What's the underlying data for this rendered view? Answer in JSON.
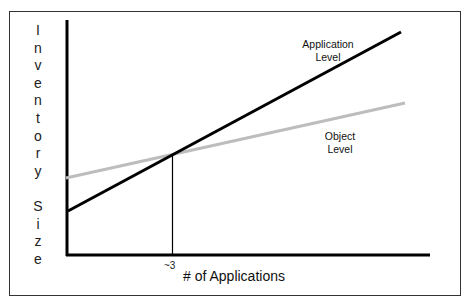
{
  "chart_data": {
    "type": "line",
    "title": "",
    "xlabel": "# of Applications",
    "ylabel": "Inventory Size",
    "x_ticks": [
      "~3"
    ],
    "grid": false,
    "legend": "inline labels",
    "series": [
      {
        "name": "Application Level",
        "color": "#000000",
        "x": [
          0,
          10
        ],
        "y": [
          1.0,
          5.2
        ],
        "note": "steeper line, starts lower"
      },
      {
        "name": "Object Level",
        "color": "#bbbbbb",
        "x": [
          0,
          10
        ],
        "y": [
          1.7,
          3.3
        ],
        "note": "shallower line, starts higher"
      }
    ],
    "annotations": [
      {
        "type": "vertical-line",
        "x": 3,
        "label": "~3",
        "note": "crossover point of the two lines"
      }
    ]
  },
  "labels": {
    "y_axis_letters": [
      "I",
      "n",
      "v",
      "e",
      "n",
      "t",
      "o",
      "r",
      "y",
      "",
      "S",
      "i",
      "z",
      "e"
    ],
    "app_level_line1": "Application",
    "app_level_line2": "Level",
    "obj_level_line1": "Object",
    "obj_level_line2": "Level",
    "x_axis": "# of Applications",
    "tick": "~3"
  }
}
